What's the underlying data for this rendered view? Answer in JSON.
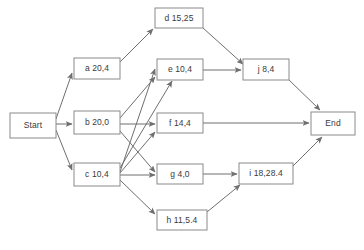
{
  "diagram": {
    "type": "directed-graph",
    "background_color": "#ffffff",
    "node_border_color": "#8a8a8a",
    "node_fill_color": "#ffffff",
    "edge_color": "#6f6f6f",
    "text_color": "#3a3a3a",
    "nodes": [
      {
        "id": "start",
        "label": "Start",
        "x": 10,
        "y": 113,
        "w": 46,
        "h": 25
      },
      {
        "id": "a",
        "label": "a 20,4",
        "x": 74,
        "y": 58,
        "w": 46,
        "h": 21
      },
      {
        "id": "b",
        "label": "b 20,0",
        "x": 74,
        "y": 111,
        "w": 46,
        "h": 23
      },
      {
        "id": "c",
        "label": "c 10,4",
        "x": 74,
        "y": 163,
        "w": 46,
        "h": 23
      },
      {
        "id": "d",
        "label": "d 15,25",
        "x": 155,
        "y": 8,
        "w": 48,
        "h": 20
      },
      {
        "id": "e",
        "label": "e 10,4",
        "x": 157,
        "y": 59,
        "w": 46,
        "h": 21
      },
      {
        "id": "f",
        "label": "f 14,4",
        "x": 157,
        "y": 113,
        "w": 46,
        "h": 20
      },
      {
        "id": "g",
        "label": "g 4,0",
        "x": 157,
        "y": 164,
        "w": 46,
        "h": 20
      },
      {
        "id": "h",
        "label": "h 11,5.4",
        "x": 157,
        "y": 210,
        "w": 50,
        "h": 20
      },
      {
        "id": "j",
        "label": "j 8,4",
        "x": 243,
        "y": 59,
        "w": 46,
        "h": 21
      },
      {
        "id": "i",
        "label": "i 18,28.4",
        "x": 239,
        "y": 163,
        "w": 54,
        "h": 21
      },
      {
        "id": "end",
        "label": "End",
        "x": 311,
        "y": 112,
        "w": 44,
        "h": 23
      }
    ],
    "edges": [
      {
        "from": "start",
        "to": "a",
        "x1": 56,
        "y1": 119,
        "x2": 72,
        "y2": 73
      },
      {
        "from": "start",
        "to": "b",
        "x1": 56,
        "y1": 124,
        "x2": 72,
        "y2": 124
      },
      {
        "from": "start",
        "to": "c",
        "x1": 56,
        "y1": 130,
        "x2": 72,
        "y2": 170
      },
      {
        "from": "a",
        "to": "d",
        "x1": 120,
        "y1": 62,
        "x2": 153,
        "y2": 29
      },
      {
        "from": "b",
        "to": "e",
        "x1": 120,
        "y1": 118,
        "x2": 155,
        "y2": 77
      },
      {
        "from": "b",
        "to": "f",
        "x1": 120,
        "y1": 124,
        "x2": 155,
        "y2": 124
      },
      {
        "from": "b",
        "to": "g",
        "x1": 120,
        "y1": 131,
        "x2": 155,
        "y2": 172
      },
      {
        "from": "c",
        "to": "e",
        "x1": 120,
        "y1": 168,
        "x2": 172,
        "y2": 81
      },
      {
        "from": "c",
        "to": "e",
        "x1": 120,
        "y1": 172,
        "x2": 155,
        "y2": 69
      },
      {
        "from": "c",
        "to": "f",
        "x1": 120,
        "y1": 173,
        "x2": 155,
        "y2": 132
      },
      {
        "from": "c",
        "to": "g",
        "x1": 120,
        "y1": 175,
        "x2": 155,
        "y2": 175
      },
      {
        "from": "c",
        "to": "h",
        "x1": 120,
        "y1": 180,
        "x2": 155,
        "y2": 214
      },
      {
        "from": "d",
        "to": "j",
        "x1": 203,
        "y1": 28,
        "x2": 243,
        "y2": 64
      },
      {
        "from": "e",
        "to": "j",
        "x1": 203,
        "y1": 70,
        "x2": 241,
        "y2": 70
      },
      {
        "from": "g",
        "to": "i",
        "x1": 203,
        "y1": 174,
        "x2": 237,
        "y2": 174
      },
      {
        "from": "h",
        "to": "i",
        "x1": 207,
        "y1": 212,
        "x2": 240,
        "y2": 185
      },
      {
        "from": "j",
        "to": "end",
        "x1": 289,
        "y1": 80,
        "x2": 320,
        "y2": 110
      },
      {
        "from": "f",
        "to": "end",
        "x1": 203,
        "y1": 123,
        "x2": 309,
        "y2": 123
      },
      {
        "from": "i",
        "to": "end",
        "x1": 293,
        "y1": 166,
        "x2": 322,
        "y2": 137
      }
    ]
  }
}
